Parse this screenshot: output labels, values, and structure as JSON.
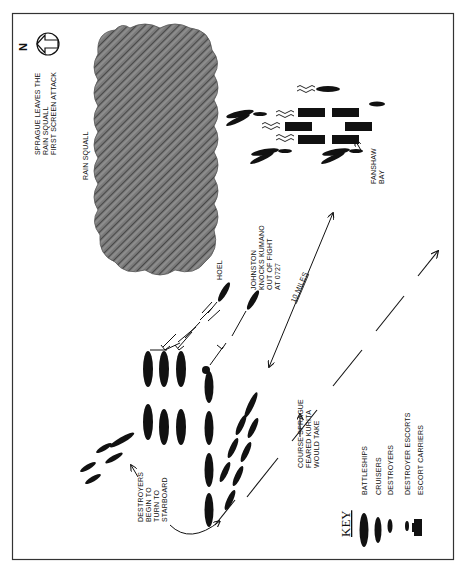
{
  "compass": {
    "label": "N",
    "icon": "north-arrow-icon"
  },
  "labels": {
    "heading": [
      "SPRAGUE LEAVES THE",
      "RAIN SQUALL",
      "FIRST SCREEN ATTACK"
    ],
    "rain_squall": "RAIN SQUALL",
    "hoel": "HOEL",
    "johnston": [
      "JOHNSTON",
      "KNOCKS KUMANO",
      "OUT OF FIGHT",
      "AT 0727"
    ],
    "scale": "10 MILES",
    "fanshaw_bay": [
      "FANSHAW",
      "BAY"
    ],
    "destroyers_turn": [
      "DESTROYERS",
      "BEGIN TO",
      "TURN TO",
      "STARBOARD"
    ],
    "course_feared": [
      "COURSE SPRAGUE",
      "FEARED KURITA",
      "WOULD TAKE"
    ]
  },
  "key": {
    "title": "KEY",
    "items": [
      {
        "label": "BATTLESHIPS",
        "symbol": "large-ellipse"
      },
      {
        "label": "CRUISERS",
        "symbol": "medium-ellipse"
      },
      {
        "label": "DESTROYERS",
        "symbol": "small-ellipse"
      },
      {
        "label": "DESTROYER ESCORTS",
        "symbol": "tiny-ellipse"
      },
      {
        "label": "ESCORT CARRIERS",
        "symbol": "rectangle"
      }
    ]
  },
  "colors": {
    "ink": "#111111",
    "squall": "#6e6e6e",
    "frame": "#333333"
  }
}
